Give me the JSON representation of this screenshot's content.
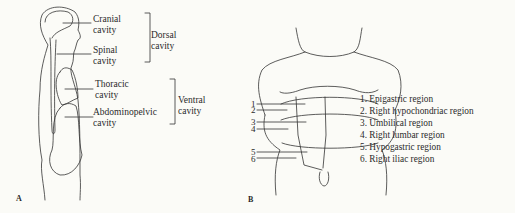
{
  "panel_a": {
    "letter": "A",
    "labels": {
      "cranial": [
        "Cranial",
        "cavity"
      ],
      "spinal": [
        "Spinal",
        "cavity"
      ],
      "dorsal": [
        "Dorsal",
        "cavity"
      ],
      "thoracic": [
        "Thoracic",
        "cavity"
      ],
      "abdominopelvic": [
        "Abdominopelvic",
        "cavity"
      ],
      "ventral": [
        "Ventral",
        "cavity"
      ]
    }
  },
  "panel_b": {
    "letter": "B",
    "numbers": [
      "1",
      "2",
      "3",
      "4",
      "5",
      "6"
    ],
    "regions": [
      "1.  Epigastric region",
      "2.  Right hypochondriac region",
      "3.  Umbilical region",
      "4.  Right lumbar region",
      "5.  Hypogastric region",
      "6.  Right iliac region"
    ]
  }
}
